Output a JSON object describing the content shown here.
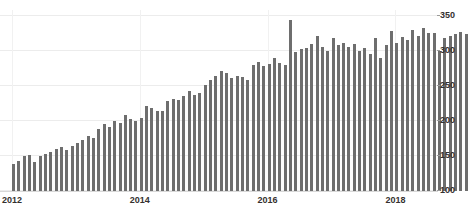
{
  "chart": {
    "title_sliver": "",
    "accent_color": "#6e6e6e",
    "grid_color": "#ececec",
    "background": "#ffffff",
    "axis_text_color": "#35312f"
  },
  "chart_data": {
    "type": "bar",
    "title": "",
    "subtitle": "",
    "xlabel": "",
    "ylabel": "",
    "ylim": [
      100,
      350
    ],
    "yticks": [
      100,
      150,
      200,
      250,
      300,
      350
    ],
    "xticks": [
      "2012",
      "2014",
      "2016",
      "2018"
    ],
    "xtick_values": [
      2012,
      2014,
      2016,
      2018
    ],
    "grid": true,
    "legend": null,
    "bar_color": "#6e6e6e",
    "series": [
      {
        "name": "Monthly value",
        "values": [
          138,
          143,
          150,
          152,
          142,
          150,
          153,
          156,
          160,
          163,
          158,
          165,
          168,
          173,
          178,
          176,
          188,
          196,
          192,
          200,
          197,
          208,
          203,
          200,
          205,
          222,
          218,
          214,
          214,
          228,
          231,
          230,
          236,
          243,
          237,
          240,
          252,
          258,
          264,
          272,
          268,
          262,
          265,
          263,
          258,
          280,
          284,
          278,
          281,
          290,
          283,
          280,
          345,
          298,
          303,
          305,
          310,
          322,
          306,
          300,
          318,
          308,
          312,
          306,
          310,
          300,
          305,
          296,
          318,
          290,
          308,
          328,
          312,
          320,
          316,
          330,
          322,
          333,
          326,
          326,
          300,
          318,
          322,
          324,
          327,
          325,
          322,
          326,
          328,
          348
        ]
      }
    ],
    "x_start_year": 2012,
    "x_start_month": 1,
    "frequency": "monthly",
    "n_points": 90
  }
}
